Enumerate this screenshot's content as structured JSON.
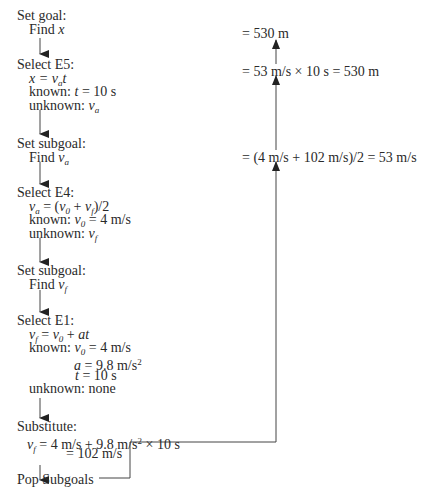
{
  "left_steps": [
    {
      "heading": "Set goal:",
      "lines": [
        "Find x"
      ]
    },
    {
      "heading": "Select E5:",
      "lines": [
        "x = v_a t",
        "known: t = 10 s",
        "unknown: v_a"
      ]
    },
    {
      "heading": "Set subgoal:",
      "lines": [
        "Find v_a"
      ]
    },
    {
      "heading": "Select E4:",
      "lines": [
        "v_a = (v_0 + v_f)/2",
        "known: v_0 = 4 m/s",
        "unknown: v_f"
      ]
    },
    {
      "heading": "Set subgoal:",
      "lines": [
        "Find v_f"
      ]
    },
    {
      "heading": "Select E1:",
      "lines": [
        "v_f = v_0 + at",
        "known: v_0 = 4 m/s",
        "a = 9.8 m/s^2",
        "t = 10 s",
        "unknown: none"
      ]
    },
    {
      "heading": "Substitute:",
      "lines": [
        "v_f = 4 m/s + 9.8 m/s^2 × 10 s",
        "= 102 m/s"
      ]
    },
    {
      "heading": "Pop Subgoals",
      "lines": []
    }
  ],
  "labels": {
    "set_goal": "Set goal:",
    "find": "Find",
    "select_e5": "Select E5:",
    "set_subgoal": "Set subgoal:",
    "select_e4": "Select E4:",
    "select_e1": "Select E1:",
    "substitute": "Substitute:",
    "pop_subgoals": "Pop Subgoals",
    "known": "known:",
    "unknown": "unknown:",
    "none": "none"
  },
  "values": {
    "t": "10 s",
    "v0": "4 m/s",
    "a": "9.8 m/s",
    "vf_expr_tail": "× 10 s",
    "vf_result": "= 102 m/s"
  },
  "right_results": [
    {
      "text": "= 530 m"
    },
    {
      "text": "= 53 m/s × 10 s = 530 m"
    },
    {
      "text": "= (4 m/s + 102 m/s)/2 = 53 m/s"
    }
  ]
}
